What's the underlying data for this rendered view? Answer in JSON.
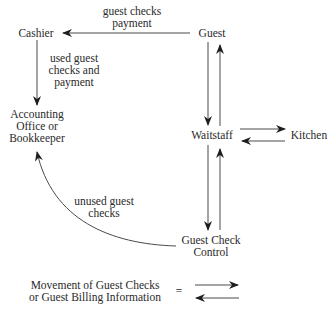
{
  "nodes": {
    "cashier": "Cashier",
    "guest": "Guest",
    "accounting": [
      "Accounting",
      "Office or",
      "Bookkeeper"
    ],
    "waitstaff": "Waitstaff",
    "kitchen": "Kitchen",
    "guest_check_control": [
      "Guest Check",
      "Control"
    ]
  },
  "edges": {
    "guest_to_cashier": [
      "guest checks",
      "payment"
    ],
    "cashier_to_accounting": [
      "used guest",
      "checks and",
      "payment"
    ],
    "gcc_to_accounting": [
      "unused guest",
      "checks"
    ]
  },
  "legend": {
    "text": [
      "Movement of Guest Checks",
      "or Guest Billing Information"
    ],
    "equals": "="
  },
  "colors": {
    "line": "#3a3a3a",
    "text": "#2a2a2a"
  }
}
